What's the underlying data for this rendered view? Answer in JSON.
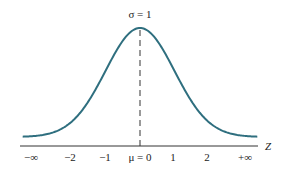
{
  "chart_data": {
    "type": "line",
    "title": "",
    "annotation": "σ = 1",
    "xlabel": "Z",
    "ylabel": "",
    "tick_labels": [
      "−∞",
      "−2",
      "−1",
      "μ = 0",
      "1",
      "2",
      "+∞"
    ],
    "tick_values": [
      -3.2,
      -2,
      -1,
      0,
      1,
      2,
      3.2
    ],
    "series": [
      {
        "name": "standard normal density",
        "mean": 0,
        "sd": 1,
        "x_range": [
          -3.4,
          3.4
        ]
      }
    ],
    "mean_marker": {
      "x": 0,
      "style": "dashed"
    },
    "grid": false,
    "legend": "none",
    "curve_color": "#2f6f7f"
  }
}
